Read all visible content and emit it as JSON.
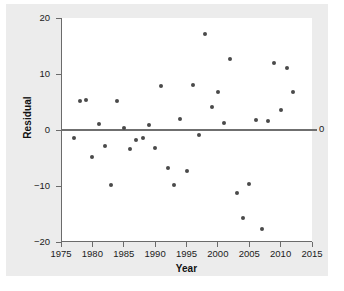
{
  "chart_data": {
    "type": "scatter",
    "title": "",
    "xlabel": "Year",
    "ylabel": "Residual",
    "xlim": [
      1975,
      2015
    ],
    "ylim": [
      -20,
      20
    ],
    "grid": false,
    "legend": null,
    "xticks": [
      "1975",
      "1980",
      "1985",
      "1990",
      "1995",
      "2000",
      "2005",
      "2010",
      "2015"
    ],
    "xtick_values": [
      1975,
      1980,
      1985,
      1990,
      1995,
      2000,
      2005,
      2010,
      2015
    ],
    "yticks": [
      "20",
      "10",
      "0",
      "-10",
      "-20"
    ],
    "ytick_values": [
      20,
      10,
      0,
      -10,
      -20
    ],
    "reference_line": {
      "y": 0,
      "label": "0",
      "color": "#6f6f6f"
    },
    "marker_color": "#4a4a4a",
    "points": [
      {
        "x": 1977,
        "y": -1.4
      },
      {
        "x": 1978,
        "y": 5.2
      },
      {
        "x": 1979,
        "y": 5.4
      },
      {
        "x": 1980,
        "y": -4.9
      },
      {
        "x": 1981,
        "y": 1.1
      },
      {
        "x": 1982,
        "y": -2.9
      },
      {
        "x": 1983,
        "y": -9.8
      },
      {
        "x": 1984,
        "y": 5.1
      },
      {
        "x": 1985,
        "y": 0.4
      },
      {
        "x": 1986,
        "y": -3.4
      },
      {
        "x": 1987,
        "y": -1.7
      },
      {
        "x": 1988,
        "y": -1.4
      },
      {
        "x": 1989,
        "y": 0.9
      },
      {
        "x": 1990,
        "y": -3.2
      },
      {
        "x": 1991,
        "y": 7.9
      },
      {
        "x": 1992,
        "y": -6.8
      },
      {
        "x": 1993,
        "y": -9.8
      },
      {
        "x": 1994,
        "y": 2.0
      },
      {
        "x": 1995,
        "y": -7.4
      },
      {
        "x": 1996,
        "y": 8.1
      },
      {
        "x": 1997,
        "y": -0.9
      },
      {
        "x": 1998,
        "y": 17.1
      },
      {
        "x": 1999,
        "y": 4.1
      },
      {
        "x": 2000,
        "y": 6.8
      },
      {
        "x": 2001,
        "y": 1.2
      },
      {
        "x": 2002,
        "y": 12.7
      },
      {
        "x": 2003,
        "y": -11.2
      },
      {
        "x": 2004,
        "y": -15.8
      },
      {
        "x": 2005,
        "y": -9.6
      },
      {
        "x": 2006,
        "y": 1.8
      },
      {
        "x": 2007,
        "y": -17.7
      },
      {
        "x": 2008,
        "y": 1.6
      },
      {
        "x": 2009,
        "y": 12.0
      },
      {
        "x": 2010,
        "y": 3.5
      },
      {
        "x": 2011,
        "y": 11.1
      },
      {
        "x": 2012,
        "y": 6.8
      }
    ]
  }
}
